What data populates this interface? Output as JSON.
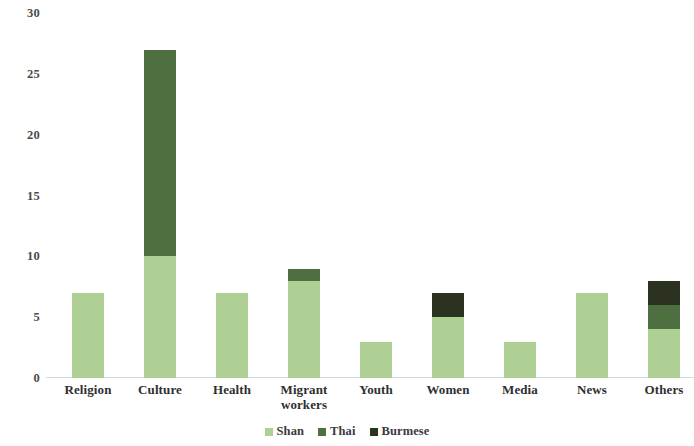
{
  "chart_data": {
    "type": "bar",
    "subtype": "stacked-vertical",
    "title": "",
    "xlabel": "",
    "ylabel": "",
    "ylim": [
      0,
      30
    ],
    "yticks": [
      0,
      5,
      10,
      15,
      20,
      25,
      30
    ],
    "grid": false,
    "legend_position": "bottom-center",
    "categories": [
      "Religion",
      "Culture",
      "Health",
      "Migrant workers",
      "Youth",
      "Women",
      "Media",
      "News",
      "Others"
    ],
    "series": [
      {
        "name": "Shan",
        "color": "#aed094",
        "values": [
          7,
          10,
          7,
          8,
          3,
          5,
          3,
          7,
          4
        ]
      },
      {
        "name": "Thai",
        "color": "#4e7040",
        "values": [
          0,
          17,
          0,
          1,
          0,
          0,
          0,
          0,
          2
        ]
      },
      {
        "name": "Burmese",
        "color": "#2b3320",
        "values": [
          0,
          0,
          0,
          0,
          0,
          2,
          0,
          0,
          2
        ]
      }
    ],
    "totals": [
      7,
      27,
      7,
      9,
      3,
      7,
      3,
      7,
      8
    ]
  },
  "axis": {
    "y_tick_labels": [
      "0",
      "5",
      "10",
      "15",
      "20",
      "25",
      "30"
    ]
  },
  "legend": {
    "items": [
      {
        "label": "Shan",
        "color": "#aed094"
      },
      {
        "label": "Thai",
        "color": "#4e7040"
      },
      {
        "label": "Burmese",
        "color": "#2b3320"
      }
    ]
  },
  "x_axis_labels": [
    "Religion",
    "Culture",
    "Health",
    "Migrant workers",
    "Youth",
    "Women",
    "Media",
    "News",
    "Others"
  ]
}
